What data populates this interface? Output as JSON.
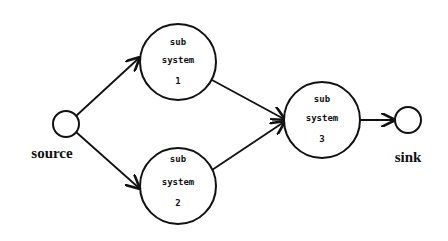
{
  "diagram": {
    "type": "reliability-network",
    "terminals": {
      "source": {
        "label": "source"
      },
      "sink": {
        "label": "sink"
      }
    },
    "nodes": [
      {
        "id": "s1",
        "line1": "sub",
        "line2": "system",
        "line3": "1"
      },
      {
        "id": "s2",
        "line1": "sub",
        "line2": "system",
        "line3": "2"
      },
      {
        "id": "s3",
        "line1": "sub",
        "line2": "system",
        "line3": "3"
      }
    ],
    "edges": [
      {
        "from": "source",
        "to": "s1"
      },
      {
        "from": "source",
        "to": "s2"
      },
      {
        "from": "s1",
        "to": "s3"
      },
      {
        "from": "s2",
        "to": "s3"
      },
      {
        "from": "s3",
        "to": "sink"
      }
    ],
    "colors": {
      "stroke": "#111111",
      "background": "#ffffff"
    }
  }
}
